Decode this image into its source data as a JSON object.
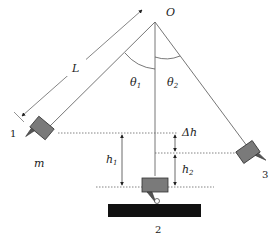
{
  "diagram": {
    "type": "ballistic-pendulum-style physics diagram",
    "pivot_label": "O",
    "length_label": "L",
    "angle_labels": {
      "theta1": "θ",
      "theta1_sub": "1",
      "theta2": "θ",
      "theta2_sub": "2"
    },
    "mass_label": "m",
    "positions": [
      {
        "id": "1",
        "label": "1",
        "description": "left raised position"
      },
      {
        "id": "2",
        "label": "2",
        "description": "lowest position above base"
      },
      {
        "id": "3",
        "label": "3",
        "description": "right raised position"
      }
    ],
    "heights": {
      "h1": {
        "label": "h",
        "sub": "1"
      },
      "h2": {
        "label": "h",
        "sub": "2"
      },
      "delta_h": {
        "label": "Δh"
      }
    },
    "colors": {
      "line": "#555555",
      "block_fill": "#7a7a7a",
      "block_stroke": "#333333",
      "base": "#111111",
      "dotted": "#666666"
    }
  }
}
